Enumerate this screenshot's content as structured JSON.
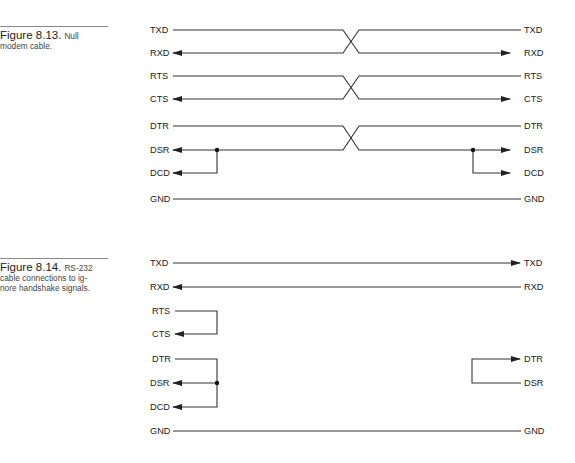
{
  "figures": [
    {
      "number": "Figure 8.13.",
      "caption": "Null modem cable.",
      "left_signals": [
        "TXD",
        "RXD",
        "RTS",
        "CTS",
        "DTR",
        "DSR",
        "DCD",
        "GND"
      ],
      "right_signals": [
        "TXD",
        "RXD",
        "RTS",
        "CTS",
        "DTR",
        "DSR",
        "DCD",
        "GND"
      ],
      "connections": [
        {
          "from": "TXD",
          "to": "RXD",
          "crossed": true
        },
        {
          "from": "RTS",
          "to": "CTS",
          "crossed": true
        },
        {
          "from": "DTR",
          "to": "DSR+DCD",
          "crossed": true
        },
        {
          "from": "GND",
          "to": "GND",
          "crossed": false
        }
      ]
    },
    {
      "number": "Figure 8.14.",
      "caption": "RS-232 cable connections to ignore handshake signals.",
      "caption_lines": [
        "RS-232",
        "cable connections to ig-",
        "nore handshake signals."
      ],
      "left_signals": [
        "TXD",
        "RXD",
        "RTS",
        "CTS",
        "DTR",
        "DSR",
        "DCD",
        "GND"
      ],
      "right_signals": [
        "TXD",
        "RXD",
        "DTR",
        "DSR",
        "GND"
      ],
      "connections": [
        {
          "from": "TXD",
          "to": "TXD (right)"
        },
        {
          "from": "RXD (right)",
          "to": "RXD"
        },
        {
          "from": "RTS",
          "to": "CTS",
          "loopback": "left"
        },
        {
          "from": "DTR",
          "to": "DSR+DCD",
          "loopback": "left"
        },
        {
          "from": "DSR",
          "to": "DTR",
          "loopback": "right"
        },
        {
          "from": "GND",
          "to": "GND"
        }
      ]
    }
  ]
}
